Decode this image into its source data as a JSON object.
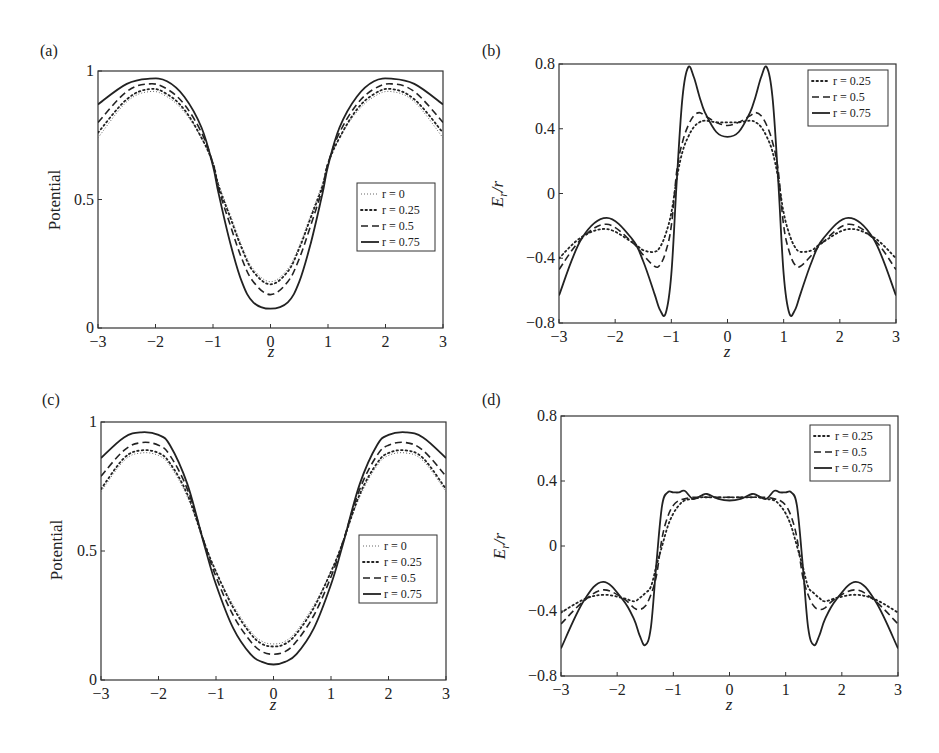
{
  "chart_data": [
    {
      "panel": "(a)",
      "type": "line",
      "xlabel": "z",
      "ylabel": "Potential",
      "xlim": [
        -3,
        3
      ],
      "ylim": [
        0,
        1
      ],
      "xticks": [
        "-3",
        "-2",
        "-1",
        "0",
        "1",
        "2",
        "3"
      ],
      "yticks": [
        "0",
        "0.5",
        "1"
      ],
      "legend": [
        "r = 0",
        "r = 0.25",
        "r = 0.5",
        "r = 0.75"
      ],
      "legend_position": "right-middle",
      "x": [
        -3,
        -2.5,
        -2.1,
        -1.8,
        -1.5,
        -1.2,
        -1.0,
        -0.9,
        -0.7,
        -0.5,
        -0.3,
        0,
        0.3,
        0.5,
        0.7,
        0.9,
        1.0,
        1.2,
        1.5,
        1.8,
        2.1,
        2.5,
        3
      ],
      "series": [
        {
          "name": "r = 0",
          "style": "fine-dot",
          "values": [
            0.74,
            0.88,
            0.92,
            0.9,
            0.84,
            0.74,
            0.64,
            0.56,
            0.44,
            0.32,
            0.23,
            0.18,
            0.23,
            0.32,
            0.44,
            0.56,
            0.64,
            0.74,
            0.84,
            0.9,
            0.92,
            0.88,
            0.74
          ]
        },
        {
          "name": "r = 0.25",
          "style": "dot",
          "values": [
            0.76,
            0.89,
            0.93,
            0.91,
            0.85,
            0.74,
            0.64,
            0.55,
            0.43,
            0.31,
            0.22,
            0.17,
            0.22,
            0.31,
            0.43,
            0.55,
            0.64,
            0.74,
            0.85,
            0.91,
            0.93,
            0.89,
            0.76
          ]
        },
        {
          "name": "r = 0.5",
          "style": "dash",
          "values": [
            0.8,
            0.92,
            0.95,
            0.93,
            0.87,
            0.76,
            0.64,
            0.54,
            0.4,
            0.27,
            0.18,
            0.13,
            0.18,
            0.27,
            0.4,
            0.54,
            0.64,
            0.76,
            0.87,
            0.93,
            0.95,
            0.92,
            0.8
          ]
        },
        {
          "name": "r = 0.75",
          "style": "solid",
          "values": [
            0.87,
            0.95,
            0.97,
            0.96,
            0.9,
            0.78,
            0.63,
            0.52,
            0.33,
            0.18,
            0.1,
            0.075,
            0.1,
            0.18,
            0.33,
            0.52,
            0.63,
            0.78,
            0.9,
            0.96,
            0.97,
            0.95,
            0.87
          ]
        }
      ]
    },
    {
      "panel": "(b)",
      "type": "line",
      "xlabel": "z",
      "ylabel": "Er/r",
      "xlim": [
        -3,
        3
      ],
      "ylim": [
        -0.8,
        0.8
      ],
      "xticks": [
        "-3",
        "-2",
        "-1",
        "0",
        "1",
        "2",
        "3"
      ],
      "yticks": [
        "-0.8",
        "-0.4",
        "0",
        "0.4",
        "0.8"
      ],
      "legend": [
        "r = 0.25",
        "r = 0.5",
        "r = 0.75"
      ],
      "legend_position": "upper-right",
      "x": [
        -3,
        -2.6,
        -2.15,
        -1.7,
        -1.5,
        -1.3,
        -1.2,
        -1.1,
        -1.0,
        -0.9,
        -0.8,
        -0.7,
        -0.6,
        -0.5,
        -0.4,
        -0.2,
        0,
        0.2,
        0.4,
        0.5,
        0.6,
        0.7,
        0.8,
        0.9,
        1.0,
        1.1,
        1.2,
        1.3,
        1.5,
        1.7,
        2.15,
        2.6,
        3
      ],
      "series": [
        {
          "name": "r = 0.25",
          "style": "dot",
          "values": [
            -0.4,
            -0.27,
            -0.22,
            -0.3,
            -0.35,
            -0.36,
            -0.33,
            -0.25,
            -0.12,
            0.1,
            0.26,
            0.35,
            0.41,
            0.44,
            0.45,
            0.44,
            0.44,
            0.44,
            0.45,
            0.44,
            0.41,
            0.35,
            0.26,
            0.1,
            -0.12,
            -0.25,
            -0.33,
            -0.36,
            -0.35,
            -0.3,
            -0.22,
            -0.27,
            -0.4
          ]
        },
        {
          "name": "r = 0.5",
          "style": "dash",
          "values": [
            -0.47,
            -0.28,
            -0.19,
            -0.3,
            -0.38,
            -0.45,
            -0.44,
            -0.36,
            -0.2,
            0.15,
            0.32,
            0.42,
            0.48,
            0.5,
            0.48,
            0.44,
            0.42,
            0.44,
            0.48,
            0.5,
            0.48,
            0.42,
            0.32,
            0.15,
            -0.2,
            -0.36,
            -0.44,
            -0.45,
            -0.38,
            -0.3,
            -0.19,
            -0.28,
            -0.47
          ]
        },
        {
          "name": "r = 0.75",
          "style": "solid",
          "values": [
            -0.63,
            -0.28,
            -0.15,
            -0.28,
            -0.42,
            -0.62,
            -0.72,
            -0.74,
            -0.5,
            0.1,
            0.6,
            0.78,
            0.72,
            0.6,
            0.5,
            0.38,
            0.35,
            0.38,
            0.5,
            0.6,
            0.72,
            0.78,
            0.6,
            0.1,
            -0.5,
            -0.74,
            -0.72,
            -0.62,
            -0.42,
            -0.28,
            -0.15,
            -0.28,
            -0.63
          ]
        }
      ]
    },
    {
      "panel": "(c)",
      "type": "line",
      "xlabel": "z",
      "ylabel": "Potential",
      "xlim": [
        -3,
        3
      ],
      "ylim": [
        0,
        1
      ],
      "xticks": [
        "-3",
        "-2",
        "-1",
        "0",
        "1",
        "2",
        "3"
      ],
      "yticks": [
        "0",
        "0.5",
        "1"
      ],
      "legend": [
        "r = 0",
        "r = 0.25",
        "r = 0.5",
        "r = 0.75"
      ],
      "legend_position": "right-middle",
      "x": [
        -3,
        -2.6,
        -2.3,
        -2.0,
        -1.8,
        -1.5,
        -1.2,
        -1.0,
        -0.7,
        -0.4,
        -0.2,
        0,
        0.2,
        0.4,
        0.7,
        1.0,
        1.2,
        1.5,
        1.8,
        2.0,
        2.3,
        2.6,
        3
      ],
      "series": [
        {
          "name": "r = 0",
          "style": "fine-dot",
          "values": [
            0.73,
            0.85,
            0.88,
            0.87,
            0.83,
            0.71,
            0.53,
            0.42,
            0.29,
            0.19,
            0.15,
            0.14,
            0.15,
            0.19,
            0.29,
            0.42,
            0.53,
            0.71,
            0.83,
            0.87,
            0.88,
            0.85,
            0.73
          ]
        },
        {
          "name": "r = 0.25",
          "style": "dot",
          "values": [
            0.74,
            0.86,
            0.89,
            0.88,
            0.84,
            0.72,
            0.53,
            0.42,
            0.28,
            0.18,
            0.14,
            0.13,
            0.14,
            0.18,
            0.28,
            0.42,
            0.53,
            0.72,
            0.84,
            0.88,
            0.89,
            0.86,
            0.74
          ]
        },
        {
          "name": "r = 0.5",
          "style": "dash",
          "values": [
            0.79,
            0.89,
            0.92,
            0.91,
            0.87,
            0.74,
            0.53,
            0.4,
            0.25,
            0.15,
            0.11,
            0.1,
            0.11,
            0.15,
            0.25,
            0.4,
            0.53,
            0.74,
            0.87,
            0.91,
            0.92,
            0.89,
            0.79
          ]
        },
        {
          "name": "r = 0.75",
          "style": "solid",
          "values": [
            0.86,
            0.94,
            0.96,
            0.95,
            0.91,
            0.76,
            0.52,
            0.37,
            0.2,
            0.1,
            0.07,
            0.06,
            0.07,
            0.1,
            0.2,
            0.37,
            0.52,
            0.76,
            0.91,
            0.95,
            0.96,
            0.94,
            0.86
          ]
        }
      ]
    },
    {
      "panel": "(d)",
      "type": "line",
      "xlabel": "z",
      "ylabel": "Er/r",
      "xlim": [
        -3,
        3
      ],
      "ylim": [
        -0.8,
        0.8
      ],
      "xticks": [
        "-3",
        "-2",
        "-1",
        "0",
        "1",
        "2",
        "3"
      ],
      "yticks": [
        "-0.8",
        "-0.4",
        "0",
        "0.4",
        "0.8"
      ],
      "legend": [
        "r = 0.25",
        "r = 0.5",
        "r = 0.75"
      ],
      "legend_position": "upper-right",
      "x": [
        -3,
        -2.6,
        -2.25,
        -1.9,
        -1.7,
        -1.6,
        -1.5,
        -1.4,
        -1.3,
        -1.2,
        -1.1,
        -1.0,
        -0.9,
        -0.8,
        -0.65,
        -0.5,
        -0.4,
        -0.2,
        0,
        0.2,
        0.4,
        0.5,
        0.65,
        0.8,
        0.9,
        1.0,
        1.1,
        1.2,
        1.3,
        1.4,
        1.5,
        1.6,
        1.7,
        1.9,
        2.25,
        2.6,
        3
      ],
      "series": [
        {
          "name": "r = 0.25",
          "style": "dot",
          "values": [
            -0.41,
            -0.33,
            -0.3,
            -0.32,
            -0.34,
            -0.32,
            -0.29,
            -0.25,
            -0.12,
            0.0,
            0.12,
            0.2,
            0.25,
            0.28,
            0.29,
            0.3,
            0.3,
            0.3,
            0.3,
            0.3,
            0.3,
            0.3,
            0.29,
            0.28,
            0.25,
            0.2,
            0.12,
            0.0,
            -0.12,
            -0.25,
            -0.29,
            -0.32,
            -0.34,
            -0.32,
            -0.3,
            -0.33,
            -0.41
          ]
        },
        {
          "name": "r = 0.5",
          "style": "dash",
          "values": [
            -0.48,
            -0.34,
            -0.27,
            -0.32,
            -0.38,
            -0.39,
            -0.37,
            -0.3,
            -0.18,
            0.05,
            0.18,
            0.25,
            0.28,
            0.29,
            0.3,
            0.3,
            0.3,
            0.3,
            0.3,
            0.3,
            0.3,
            0.3,
            0.3,
            0.29,
            0.28,
            0.25,
            0.18,
            0.05,
            -0.18,
            -0.3,
            -0.37,
            -0.39,
            -0.38,
            -0.32,
            -0.27,
            -0.34,
            -0.48
          ]
        },
        {
          "name": "r = 0.75",
          "style": "solid",
          "values": [
            -0.63,
            -0.34,
            -0.22,
            -0.33,
            -0.45,
            -0.55,
            -0.61,
            -0.5,
            -0.1,
            0.25,
            0.33,
            0.33,
            0.33,
            0.34,
            0.29,
            0.31,
            0.32,
            0.29,
            0.28,
            0.29,
            0.32,
            0.31,
            0.29,
            0.34,
            0.33,
            0.33,
            0.33,
            0.25,
            -0.1,
            -0.5,
            -0.61,
            -0.55,
            -0.45,
            -0.33,
            -0.22,
            -0.34,
            -0.63
          ]
        }
      ]
    }
  ],
  "panels": {
    "a": {
      "label": "(a)",
      "ylabel": "Potential",
      "xlabel": "z"
    },
    "b": {
      "label": "(b)",
      "ylabel": "E",
      "ylabel_sub": "r",
      "ylabel_tail": "/r",
      "xlabel": "z"
    },
    "c": {
      "label": "(c)",
      "ylabel": "Potential",
      "xlabel": "z"
    },
    "d": {
      "label": "(d)",
      "ylabel": "E",
      "ylabel_sub": "r",
      "ylabel_tail": "/r",
      "xlabel": "z"
    }
  },
  "colors": {
    "line": "#222222",
    "fine_dot": "#666666",
    "axis": "#333333"
  }
}
